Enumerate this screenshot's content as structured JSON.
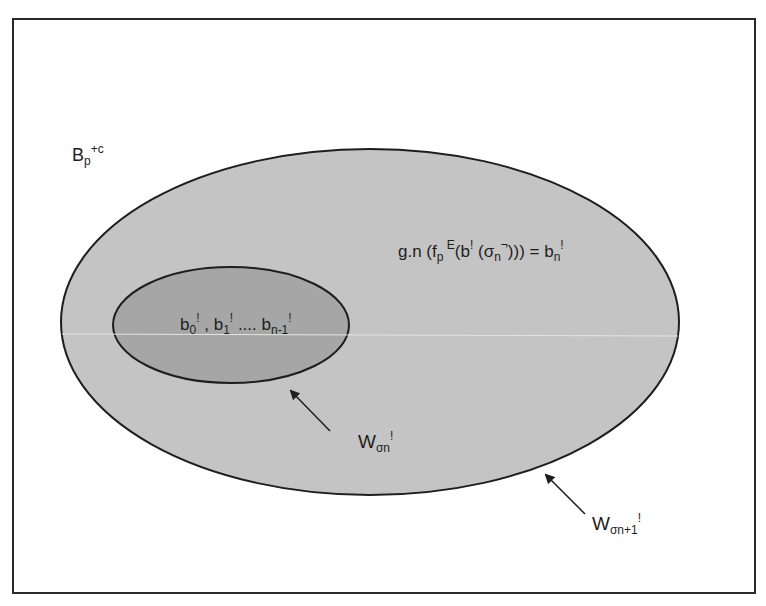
{
  "diagram": {
    "type": "nested-set-venn",
    "colors": {
      "background": "#ffffff",
      "frame_stroke": "#2a2a2a",
      "outer_fill": "#c4c4c4",
      "inner_fill": "#a6a6a6",
      "stroke": "#1e1e1e",
      "text": "#1e1e1e"
    },
    "frame_label": {
      "base": "B",
      "sub": "p",
      "sup": "+c"
    },
    "outer_set": {
      "name": "W_sigma_n_plus_1",
      "label": {
        "base": "W",
        "sub": "σn+1",
        "sup": "!"
      },
      "content": {
        "prefix": "g.n (f",
        "f_sub": "p",
        "f_sup": " E",
        "mid": "(b",
        "b_sup": "!",
        "sigma_open": " (σ",
        "sigma_sub": "n",
        "sigma_sup": "¬",
        "close": "))) = b",
        "bn_sub": "n",
        "bn_sup": "!"
      }
    },
    "inner_set": {
      "name": "W_sigma_n",
      "label": {
        "base": "W",
        "sub": "σn",
        "sup": "!"
      },
      "content": {
        "b0": "b",
        "b0_sub": "0",
        "b0_sup": "!",
        "sep1": " , b",
        "b1_sub": "1",
        "b1_sup": "!",
        "sep2": " .... b",
        "bn1_sub": "n-1",
        "bn1_sup": "!"
      }
    },
    "arrows": [
      {
        "from": "inner-set-label",
        "to": "inner-ellipse-boundary"
      },
      {
        "from": "outer-set-label",
        "to": "outer-ellipse-boundary"
      }
    ]
  }
}
